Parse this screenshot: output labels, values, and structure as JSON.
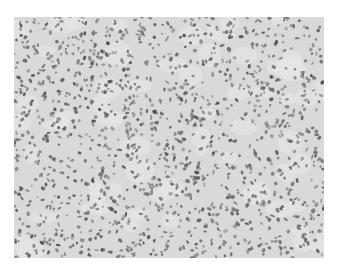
{
  "image": {
    "description": "Grayscale histology micrograph showing densely packed cells with dark oval/spindle nuclei on a pale stroma",
    "background_color": "#d9d9d9",
    "nucleus_color": "#6a6a6a",
    "frame_color": "#ffffff"
  }
}
